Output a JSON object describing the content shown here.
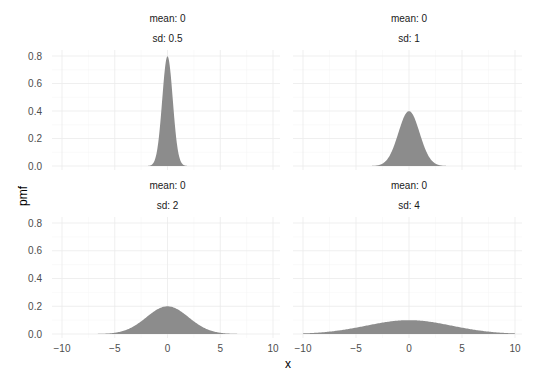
{
  "chart_data": {
    "type": "area",
    "title": "",
    "xlabel": "x",
    "ylabel": "pmf",
    "xlim": [
      -10,
      10
    ],
    "ylim": [
      0,
      0.8
    ],
    "x_ticks": [
      -10,
      -5,
      0,
      5,
      10
    ],
    "x_tick_labels": [
      "−10",
      "−5",
      "0",
      "5",
      "10"
    ],
    "y_ticks": [
      0.0,
      0.2,
      0.4,
      0.6,
      0.8
    ],
    "y_tick_labels": [
      "0.0",
      "0.2",
      "0.4",
      "0.6",
      "0.8"
    ],
    "grid": true,
    "legend": "none",
    "fill_color": "#8c8c8c",
    "facets": [
      {
        "strip_top": "mean: 0",
        "strip_bottom": "sd: 0.5",
        "mean": 0,
        "sd": 0.5,
        "peak": 0.798,
        "x_range": [
          -2,
          2
        ]
      },
      {
        "strip_top": "mean: 0",
        "strip_bottom": "sd: 1",
        "mean": 0,
        "sd": 1,
        "peak": 0.399,
        "x_range": [
          -4,
          4
        ]
      },
      {
        "strip_top": "mean: 0",
        "strip_bottom": "sd: 2",
        "mean": 0,
        "sd": 2,
        "peak": 0.199,
        "x_range": [
          -8,
          8
        ]
      },
      {
        "strip_top": "mean: 0",
        "strip_bottom": "sd: 4",
        "mean": 0,
        "sd": 4,
        "peak": 0.0997,
        "x_range": [
          -10,
          10
        ]
      }
    ]
  },
  "labels": {
    "x_axis_title": "x",
    "y_axis_title": "pmf"
  }
}
